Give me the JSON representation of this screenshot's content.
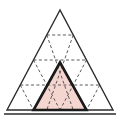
{
  "figure": {
    "background_color": "#ffffff"
  },
  "colors": {
    "outline": "#2b2b2b",
    "dashed_grid": "#5a5a5a",
    "shaded_fill": "#f5d5d0",
    "shaded_outline": "#1a1a1a",
    "baseline": "#2b2b2b"
  },
  "geometry": {
    "outer_triangle": {
      "apex": {
        "x": 60,
        "y": 10
      },
      "bottom_left": {
        "x": 7,
        "y": 110
      },
      "bottom_right": {
        "x": 113,
        "y": 110
      },
      "subdivisions": 4,
      "total_small_triangles": 16
    },
    "shaded_triangle": {
      "row": 4,
      "position_in_row": 2,
      "orientation": "upward",
      "apex": {
        "x": 60,
        "y": 62.5
      },
      "bottom_left": {
        "x": 33.5,
        "y": 110
      },
      "bottom_right": {
        "x": 86.5,
        "y": 110
      }
    },
    "horizontal_dashed_lines_y": [
      35,
      60,
      85
    ],
    "baseline": {
      "x1": 4,
      "x2": 116,
      "y": 114
    }
  },
  "strokes": {
    "outer_width": 1.4,
    "dashed_width": 1.0,
    "dash_pattern": "3,2.4",
    "shaded_outline_width": 2.6,
    "baseline_width": 1.4
  },
  "labels": {
    "none_visible": ""
  }
}
